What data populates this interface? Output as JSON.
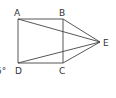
{
  "diagram": {
    "type": "geometry",
    "stroke_color": "#444444",
    "label_color": "#333333",
    "points": {
      "A": {
        "label": "A",
        "x": 18,
        "y": 19
      },
      "B": {
        "label": "B",
        "x": 63,
        "y": 19
      },
      "C": {
        "label": "C",
        "x": 63,
        "y": 63
      },
      "D": {
        "label": "D",
        "x": 18,
        "y": 63
      },
      "E": {
        "label": "E",
        "x": 100,
        "y": 42
      }
    },
    "segments": [
      [
        "A",
        "B"
      ],
      [
        "B",
        "C"
      ],
      [
        "C",
        "D"
      ],
      [
        "D",
        "A"
      ],
      [
        "A",
        "E"
      ],
      [
        "B",
        "E"
      ],
      [
        "C",
        "E"
      ],
      [
        "D",
        "E"
      ]
    ],
    "partial_label": "5°"
  }
}
